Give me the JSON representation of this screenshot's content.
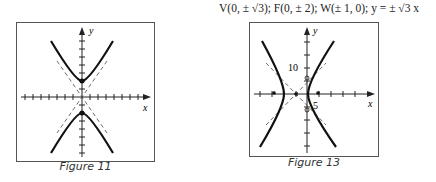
{
  "header": {
    "vertices": "V(0, ± √3);",
    "foci": "F(0, ± 2);",
    "w_points": "W(± 1, 0);",
    "asymptotes": "y = ± √3 x"
  },
  "figures": [
    {
      "caption": "Figure 11",
      "x_label": "x",
      "y_label": "y"
    },
    {
      "caption": "Figure 13",
      "x_label": "x",
      "y_label": "y",
      "tick_label_y": "10",
      "tick_label_x": "5"
    }
  ]
}
